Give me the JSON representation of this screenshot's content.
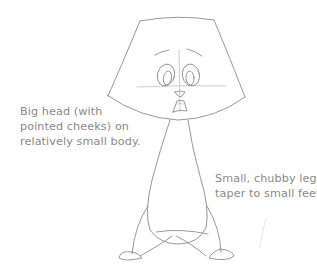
{
  "illustration": {
    "subject": "cartoon character pencil sketch",
    "colors": {
      "background": "#ffffff",
      "pencil": "#8c8c8c",
      "caption_text": "#8a8a8a"
    }
  },
  "captions": {
    "left": {
      "lines": [
        "Big head (with",
        "pointed cheeks) on",
        "relatively small body."
      ]
    },
    "right": {
      "lines": [
        "Small, chubby legs",
        "taper to small feet."
      ]
    }
  }
}
